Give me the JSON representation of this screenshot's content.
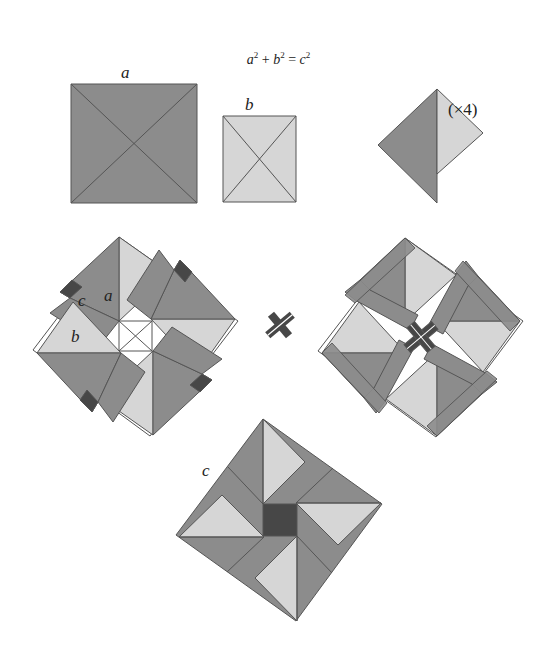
{
  "equation": {
    "a": "a",
    "b": "b",
    "c": "c",
    "sup": "2",
    "plus": "+",
    "equals": "="
  },
  "labels": {
    "square_a": "a",
    "square_b": "b",
    "multiplier": "(×4)",
    "left_c": "c",
    "left_a": "a",
    "left_b": "b",
    "bottom_c": "c"
  },
  "colors": {
    "dark": "#8c8c8c",
    "light": "#d6d6d6",
    "darkest": "#474747",
    "stroke": "#555555",
    "white": "#ffffff"
  }
}
